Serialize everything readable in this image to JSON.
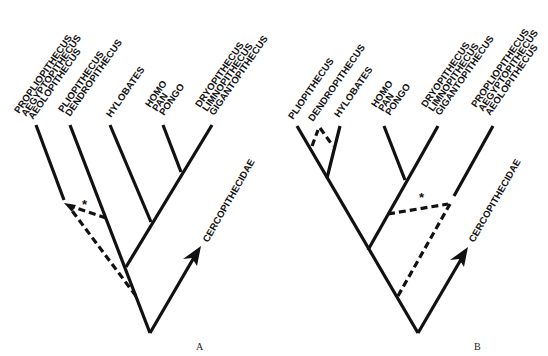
{
  "figure": {
    "panels": [
      {
        "id": "A",
        "label": "A",
        "taxa_labels": {
          "propliopithecus_group": [
            "PROPLIOPITHECUS",
            "AEGYPTOPITHECUS",
            "AEOLOPITHECUS"
          ],
          "pliopithecus_group": [
            "PLIOPITHECUS",
            "DENDROPITHECUS"
          ],
          "hylobates": [
            "HYLOBATES"
          ],
          "great_apes": [
            "HOMO",
            "PAN",
            "PONGO"
          ],
          "dryopithecus_group": [
            "DRYOPITHECUS",
            "LIMNOPITHECUS",
            "GIGANTOPITHECUS"
          ],
          "outgroup": "CERCOPITHECIDAE"
        },
        "uncertain_marker": "*"
      },
      {
        "id": "B",
        "label": "B",
        "taxa_labels": {
          "pliopithecus": [
            "PLIOPITHECUS"
          ],
          "dendropithecus": [
            "DENDROPITHECUS"
          ],
          "hylobates": [
            "HYLOBATES"
          ],
          "great_apes": [
            "HOMO",
            "PAN",
            "PONGO"
          ],
          "dryopithecus_group": [
            "DRYOPITHECUS",
            "LIMNOPITHECUS",
            "GIGANTOPITHECUS"
          ],
          "propliopithecus_group": [
            "PROPLIOPITHECUS",
            "AEGYPTOPITHECUS",
            "AEOLOPITHECUS"
          ],
          "outgroup": "CERCOPITHECIDAE"
        },
        "uncertain_marker": "*"
      }
    ],
    "colors": {
      "ink": "#111111",
      "background": "#ffffff"
    }
  }
}
